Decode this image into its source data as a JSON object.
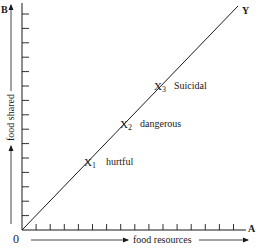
{
  "figure": {
    "corner_labels": {
      "origin": "0",
      "x_axis_end": "A",
      "y_axis_end": "B",
      "diagonal_end": "Y"
    },
    "x_axis_label": "food resources",
    "y_axis_label": "food shared",
    "x_ticks": 15,
    "y_ticks": 15,
    "points": [
      {
        "marker": "X",
        "subscript": "1",
        "label": "hurtful"
      },
      {
        "marker": "X",
        "subscript": "2",
        "label": "dangerous"
      },
      {
        "marker": "X",
        "subscript": "3",
        "label": "Suicidal"
      }
    ],
    "line_color": "#1a1a1a"
  }
}
